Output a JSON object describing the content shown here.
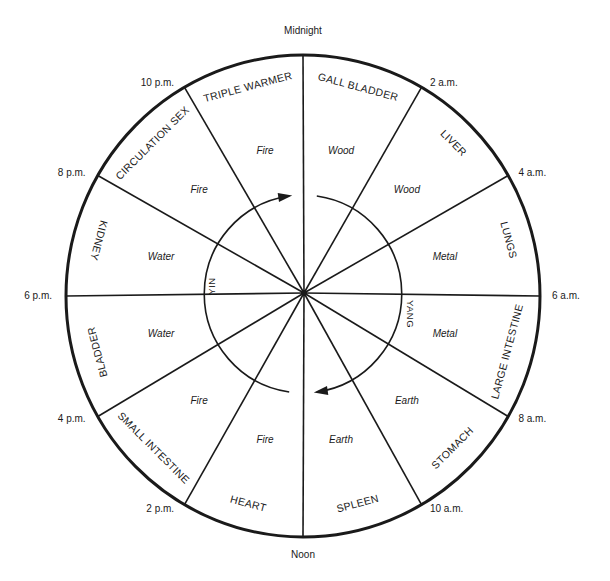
{
  "diagram": {
    "colors": {
      "ink": "#1a1a1a",
      "background": "#ffffff"
    },
    "time_labels": [
      {
        "text": "Midnight",
        "angle_deg": 0
      },
      {
        "text": "2 a.m.",
        "angle_deg": 30
      },
      {
        "text": "4 a.m.",
        "angle_deg": 60
      },
      {
        "text": "6 a.m.",
        "angle_deg": 90
      },
      {
        "text": "8 a.m.",
        "angle_deg": 120
      },
      {
        "text": "10 a.m.",
        "angle_deg": 150
      },
      {
        "text": "Noon",
        "angle_deg": 180
      },
      {
        "text": "2 p.m.",
        "angle_deg": 210
      },
      {
        "text": "4 p.m.",
        "angle_deg": 240
      },
      {
        "text": "6 p.m.",
        "angle_deg": 270
      },
      {
        "text": "8 p.m.",
        "angle_deg": 300
      },
      {
        "text": "10 p.m.",
        "angle_deg": 330
      }
    ],
    "sectors": [
      {
        "organ": "GALL BLADDER",
        "element": "Wood",
        "start_deg": 0,
        "end_deg": 30
      },
      {
        "organ": "LIVER",
        "element": "Wood",
        "start_deg": 30,
        "end_deg": 60
      },
      {
        "organ": "LUNGS",
        "element": "Metal",
        "start_deg": 60,
        "end_deg": 90
      },
      {
        "organ": "LARGE INTESTINE",
        "element": "Metal",
        "start_deg": 90,
        "end_deg": 120
      },
      {
        "organ": "STOMACH",
        "element": "Earth",
        "start_deg": 120,
        "end_deg": 150
      },
      {
        "organ": "SPLEEN",
        "element": "Earth",
        "start_deg": 150,
        "end_deg": 180
      },
      {
        "organ": "HEART",
        "element": "Fire",
        "start_deg": 180,
        "end_deg": 210
      },
      {
        "organ": "SMALL INTESTINE",
        "element": "Fire",
        "start_deg": 210,
        "end_deg": 240
      },
      {
        "organ": "BLADDER",
        "element": "Water",
        "start_deg": 240,
        "end_deg": 270
      },
      {
        "organ": "KIDNEY",
        "element": "Water",
        "start_deg": 270,
        "end_deg": 300
      },
      {
        "organ": "CIRCULATION SEX",
        "element": "Fire",
        "start_deg": 300,
        "end_deg": 330
      },
      {
        "organ": "TRIPLE WARMER",
        "element": "Fire",
        "start_deg": 330,
        "end_deg": 360
      }
    ],
    "cycle": {
      "yin_label": "YIN",
      "yang_label": "YANG",
      "yin_side": "left",
      "yang_side": "right",
      "direction": "clockwise"
    }
  }
}
